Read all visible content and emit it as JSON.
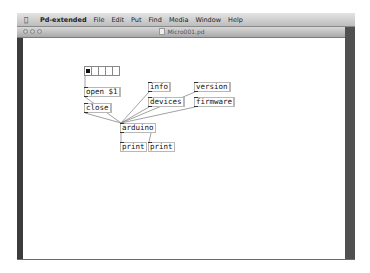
{
  "menubar": {
    "apple_icon": "",
    "items": [
      "Pd-extended",
      "File",
      "Edit",
      "Put",
      "Find",
      "Media",
      "Window",
      "Help"
    ]
  },
  "window": {
    "title": "Micro001.pd"
  },
  "patch": {
    "radio": {
      "cells": 5,
      "selected": 0
    },
    "messages": {
      "open": "open $1",
      "close": "close",
      "info": "info",
      "devices": "devices",
      "version": "version",
      "firmware": "firmware"
    },
    "objects": {
      "arduino": "arduino",
      "print1": "print",
      "print2": "print"
    }
  },
  "colors": {
    "canvas": "#ffffff",
    "frame": "#4a4a4a",
    "box_border": "#b8b8b8",
    "wire": "#888888"
  }
}
